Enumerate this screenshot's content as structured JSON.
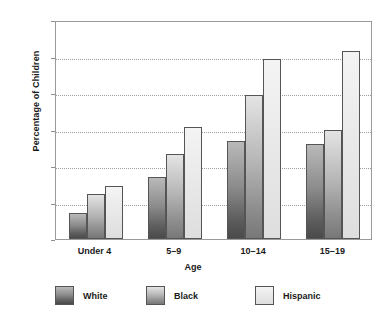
{
  "chart_data": {
    "type": "bar",
    "title": "",
    "subtitle": "",
    "xlabel": "Age",
    "ylabel": "Percentage of Children",
    "categories": [
      "Under 4",
      "5–9",
      "10–14",
      "15–19"
    ],
    "series": [
      {
        "name": "White",
        "values": [
          3.6,
          8.5,
          13.4,
          13.0
        ],
        "color": "#7a7a7a"
      },
      {
        "name": "Black",
        "values": [
          6.2,
          11.6,
          19.7,
          14.9
        ],
        "color": "#b4b4b4"
      },
      {
        "name": "Hispanic",
        "values": [
          7.2,
          15.3,
          24.7,
          25.7
        ],
        "color": "#e9e9e9"
      }
    ],
    "ylim": [
      0,
      30
    ],
    "yticks": [
      0,
      5,
      10,
      15,
      20,
      25,
      30
    ],
    "ytick_labels": [
      "0",
      "5",
      "10",
      "15",
      "20",
      "25",
      "30"
    ],
    "grid": true,
    "grid_axis": "y",
    "grid_style": "dotted",
    "legend_position": "bottom",
    "bar_style": "grouped",
    "frame": true
  },
  "legend": {
    "entries": [
      {
        "label": "White"
      },
      {
        "label": "Black"
      },
      {
        "label": "Hispanic"
      }
    ]
  }
}
